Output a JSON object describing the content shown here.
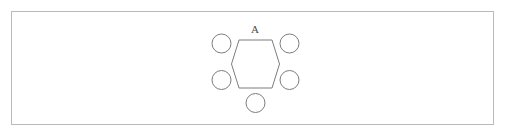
{
  "page": {
    "width": 507,
    "height": 138,
    "background_color": "#ffffff"
  },
  "frame": {
    "name": "outer-border",
    "x": 11,
    "y": 11,
    "width": 483,
    "height": 114,
    "stroke_color": "#b9b9b9",
    "stroke_width": 1,
    "fill_color": "#ffffff"
  },
  "diagram": {
    "title": "",
    "type": "ring-structure",
    "stroke_color": "#7d7d7d",
    "stroke_width": 1,
    "fill_color": "none",
    "label": {
      "text": "A",
      "x": 255,
      "y": 33,
      "font_size": 11,
      "color": "#4a4a4a"
    },
    "ring": {
      "name": "hexagon",
      "sides": 6,
      "orientation": "flat-top",
      "center_x": 255.5,
      "center_y": 64,
      "points": "239,40 272,40 279.5,64 272,88 239,88 231.5,64"
    },
    "nodes": [
      {
        "name": "node-top-left",
        "cx": 221.5,
        "cy": 43.5,
        "r": 9.5
      },
      {
        "name": "node-top-right",
        "cx": 289.5,
        "cy": 43.5,
        "r": 9.5
      },
      {
        "name": "node-bottom-left",
        "cx": 221.5,
        "cy": 80.0,
        "r": 9.5
      },
      {
        "name": "node-bottom-right",
        "cx": 289.5,
        "cy": 80.0,
        "r": 9.5
      },
      {
        "name": "node-bottom",
        "cx": 255.5,
        "cy": 103.0,
        "r": 9.5
      }
    ]
  },
  "chart_data": {
    "type": "diagram",
    "title": "A",
    "shapes": [
      {
        "shape": "hexagon",
        "label": "A",
        "vertices": 6
      },
      {
        "shape": "circle",
        "label": "",
        "count": 5
      }
    ]
  }
}
